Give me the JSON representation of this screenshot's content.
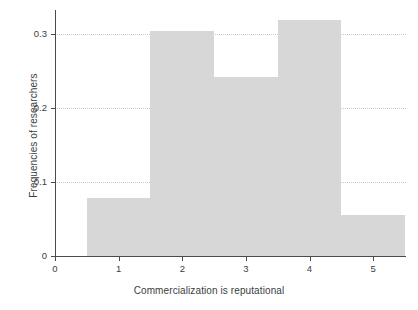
{
  "chart_data": {
    "type": "bar",
    "title": "",
    "subtitle": "",
    "xlabel": "Commercialization is reputational",
    "ylabel": "Frequencies of researchers",
    "categories": [
      "1",
      "2",
      "3",
      "4",
      "5"
    ],
    "values": [
      0.078,
      0.304,
      0.242,
      0.32,
      0.056
    ],
    "bin_edges": [
      0.5,
      1.5,
      2.5,
      3.5,
      4.5,
      5.5
    ],
    "bar_color": "#d7d7d7",
    "xlim": [
      0,
      5.5
    ],
    "ylim": [
      0,
      0.333
    ],
    "x_ticks": [
      "0",
      "1",
      "2",
      "3",
      "4",
      "5"
    ],
    "x_tick_values": [
      0,
      1,
      2,
      3,
      4,
      5
    ],
    "y_ticks": [
      "0",
      "0.1",
      "0.2",
      "0.3"
    ],
    "y_tick_values": [
      0,
      0.1,
      0.2,
      0.3
    ],
    "grid": "horizontal-dotted",
    "grid_color": "#c9c9d6",
    "legend": "none",
    "axis_color": "#4b4b4b",
    "background": "#ffffff"
  }
}
